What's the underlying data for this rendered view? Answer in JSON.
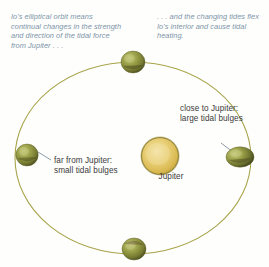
{
  "figure": {
    "background_color": "#fefefd"
  },
  "captions": {
    "left": "Io's elliptical orbit means continual changes in the strength and direction of the tidal force from Jupiter . . .",
    "right": ". . . and the changing tides flex Io's interior and cause tidal heating.",
    "color": "#7d95a8"
  },
  "labels": {
    "close": "close to Jupiter: large tidal bulges",
    "far": "far from Jupiter: small tidal bulges",
    "jupiter": "Jupiter",
    "color": "#3b3b3b"
  },
  "orbit": {
    "stroke_color": "#a8a44a",
    "stroke_width": 1.1,
    "center_x": 133,
    "center_y": 158,
    "radius_x": 118,
    "radius_y": 96
  },
  "jupiter": {
    "center_x": 160,
    "center_y": 156,
    "radius": 19,
    "fill_color": "#e0c15c",
    "highlight_color": "#f0dc9a",
    "rim_color": "#8f8436"
  },
  "moons": [
    {
      "name": "io-top",
      "position": "top",
      "center_x": 133,
      "center_y": 62,
      "radius_x": 12,
      "radius_y": 11,
      "fill_color": "#8f9340",
      "dark_color": "#5d5f28",
      "light_color": "#b6bb62"
    },
    {
      "name": "io-right",
      "position": "right",
      "center_x": 240,
      "center_y": 157,
      "radius_x": 14,
      "radius_y": 10,
      "fill_color": "#8f9340",
      "dark_color": "#5d5f28",
      "light_color": "#b6bb62"
    },
    {
      "name": "io-bottom",
      "position": "bottom",
      "center_x": 134,
      "center_y": 249,
      "radius_x": 12,
      "radius_y": 11,
      "fill_color": "#8f9340",
      "dark_color": "#5d5f28",
      "light_color": "#b6bb62"
    },
    {
      "name": "io-left",
      "position": "left",
      "center_x": 27,
      "center_y": 155,
      "radius_x": 11,
      "radius_y": 11,
      "fill_color": "#8f9340",
      "dark_color": "#5d5f28",
      "light_color": "#b6bb62"
    }
  ],
  "leader_lines": {
    "color": "#6f7f90",
    "width": 0.8,
    "close": {
      "x1": 221,
      "y1": 143,
      "x2": 233,
      "y2": 152
    },
    "far": {
      "x1": 51,
      "y1": 160,
      "x2": 38,
      "y2": 152
    }
  }
}
